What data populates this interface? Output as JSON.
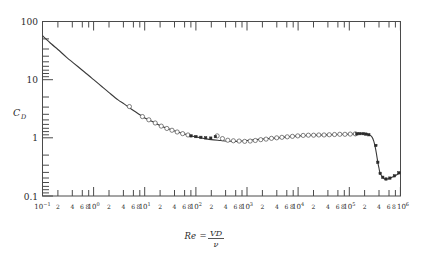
{
  "figure": {
    "kind": "drag-coefficient-log-log-plot",
    "background_color": "#ffffff",
    "ink_color": "#3a3a3a"
  },
  "axes": {
    "y_axis_label": "C",
    "y_axis_label_sub": "D",
    "y_tick_labels": [
      "100",
      "10",
      "1",
      "0.1"
    ],
    "x_caption_lhs": "Re",
    "x_caption_eq": "=",
    "x_caption_numerator": "VD",
    "x_caption_denominator": "ν",
    "x_decade_labels": [
      {
        "mantissa": "10",
        "exponent": "−1"
      },
      {
        "mantissa": "10",
        "exponent": "0"
      },
      {
        "mantissa": "10",
        "exponent": "1"
      },
      {
        "mantissa": "10",
        "exponent": "2"
      },
      {
        "mantissa": "10",
        "exponent": "3"
      },
      {
        "mantissa": "10",
        "exponent": "4"
      },
      {
        "mantissa": "10",
        "exponent": "5"
      },
      {
        "mantissa": "10",
        "exponent": "6"
      }
    ],
    "x_minor_labels": [
      "2",
      "4",
      "6",
      "8"
    ]
  },
  "chart_data": {
    "type": "line",
    "title": "",
    "xlabel": "Re = VD/ν",
    "ylabel": "C_D",
    "xscale": "log",
    "yscale": "log",
    "xlim": [
      0.1,
      1000000
    ],
    "ylim": [
      0.1,
      100
    ],
    "grid": false,
    "legend": "none",
    "series": [
      {
        "name": "Standard drag curve",
        "style": "solid-line",
        "x": [
          0.1,
          0.15,
          0.2,
          0.3,
          0.4,
          0.6,
          0.8,
          1.0,
          1.5,
          2,
          3,
          4,
          6,
          8,
          10,
          15,
          20,
          30,
          40,
          60,
          80,
          100,
          150,
          200,
          300,
          400,
          600,
          800,
          1000,
          1500,
          2000,
          3000,
          4000,
          6000,
          8000,
          10000,
          15000,
          20000,
          30000,
          40000,
          60000,
          80000,
          100000,
          130000,
          160000,
          200000,
          250000,
          280000,
          300000,
          320000,
          340000,
          360000,
          380000,
          400000,
          450000,
          500000,
          600000,
          800000,
          1000000
        ],
        "y": [
          57,
          41,
          33,
          24,
          19.5,
          14.5,
          11.8,
          10.0,
          7.4,
          6.0,
          4.5,
          3.8,
          2.95,
          2.5,
          2.2,
          1.85,
          1.62,
          1.42,
          1.3,
          1.16,
          1.08,
          1.04,
          0.97,
          0.93,
          0.9,
          0.88,
          0.87,
          0.88,
          0.9,
          0.93,
          0.95,
          0.98,
          1.0,
          1.04,
          1.06,
          1.08,
          1.1,
          1.11,
          1.12,
          1.13,
          1.14,
          1.15,
          1.16,
          1.17,
          1.18,
          1.17,
          1.12,
          1.02,
          0.88,
          0.7,
          0.52,
          0.38,
          0.3,
          0.245,
          0.21,
          0.195,
          0.2,
          0.225,
          0.255
        ]
      },
      {
        "name": "Experimental data (open circles)",
        "style": "open-circle-markers",
        "x": [
          5,
          9,
          12,
          16,
          21,
          27,
          34,
          43,
          55,
          70,
          260,
          330,
          420,
          540,
          700,
          900,
          1150,
          1450,
          1850,
          2350,
          3000,
          3800,
          4800,
          6100,
          7700,
          9800,
          12500,
          15800,
          20000,
          25300,
          32000,
          40500,
          51300,
          65000,
          82000,
          104000,
          131000
        ],
        "y": [
          3.45,
          2.32,
          2.04,
          1.8,
          1.59,
          1.45,
          1.35,
          1.26,
          1.18,
          1.12,
          1.08,
          0.97,
          0.91,
          0.89,
          0.88,
          0.87,
          0.88,
          0.9,
          0.93,
          0.95,
          0.98,
          1.0,
          1.02,
          1.04,
          1.06,
          1.08,
          1.1,
          1.11,
          1.11,
          1.12,
          1.12,
          1.13,
          1.14,
          1.15,
          1.15,
          1.16,
          1.17
        ]
      },
      {
        "name": "Experimental data (filled markers)",
        "style": "filled-square-markers",
        "x": [
          80,
          100,
          125,
          155,
          195,
          240,
          140000,
          160000,
          185000,
          210000,
          240000,
          330000,
          360000,
          400000,
          450000,
          520000,
          620000,
          760000,
          930000
        ],
        "y": [
          1.08,
          1.05,
          1.02,
          1.0,
          0.99,
          1.05,
          1.17,
          1.18,
          1.18,
          1.16,
          1.13,
          0.74,
          0.38,
          0.245,
          0.21,
          0.196,
          0.203,
          0.222,
          0.25
        ]
      }
    ],
    "annotations": [
      {
        "text": "drag crisis / critical Reynolds number transition",
        "x": 350000,
        "y": 0.5
      }
    ]
  }
}
